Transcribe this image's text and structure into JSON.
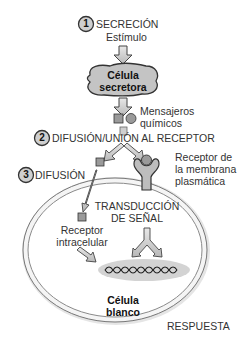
{
  "steps": [
    {
      "number": "1",
      "label": "SECRECIÓN"
    },
    {
      "number": "2",
      "label": "DIFUSIÓN/UNIÓN AL RECEPTOR"
    },
    {
      "number": "3",
      "label": "DIFUSIÓN"
    }
  ],
  "stimulus": "Estímulo",
  "secretory_cell": {
    "line1": "Célula",
    "line2": "secretora"
  },
  "messengers": {
    "line1": "Mensajeros",
    "line2": "químicos"
  },
  "membrane_receptor": {
    "line1": "Receptor de",
    "line2": "la membrana",
    "line3": "plasmática"
  },
  "transduction": {
    "line1": "TRANSDUCCIÓN",
    "line2": "DE SEÑAL"
  },
  "intracellular_receptor": {
    "line1": "Receptor",
    "line2": "intracelular"
  },
  "target_cell": {
    "line1": "Célula",
    "line2": "blanco"
  },
  "response": "RESPUESTA",
  "colors": {
    "cell_fill": "#c9c9c9",
    "outline": "#444444",
    "nucleus_fill": "#d0d0d0",
    "membrane": "#bdbdbd"
  }
}
